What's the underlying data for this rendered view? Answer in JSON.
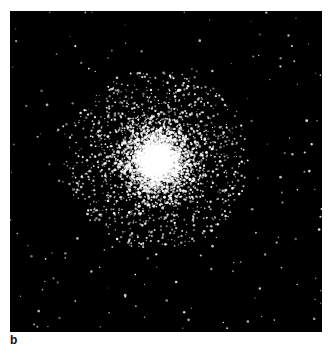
{
  "figure": {
    "panel_label": "b",
    "image": {
      "subject": "globular star cluster",
      "background_color": "#000000",
      "star_color": "#ffffff",
      "core_center": [
        147,
        149
      ],
      "core_radius": 16,
      "halo_radius": 70
    }
  }
}
